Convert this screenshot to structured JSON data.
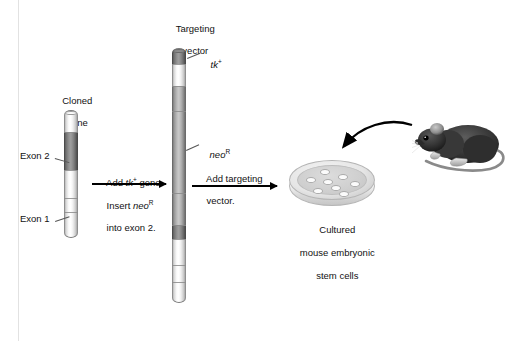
{
  "figure": {
    "background_color": "#ffffff",
    "frame_color": "#e2e2e2"
  },
  "labels": {
    "cloned_gene": "Cloned\ngene",
    "cloned_gene_line1": "Cloned",
    "cloned_gene_line2": "gene",
    "exon2": "Exon 2",
    "exon1": "Exon 1",
    "targeting_vector_line1": "Targeting",
    "targeting_vector_line2": "vector",
    "tk_gene": "tk",
    "tk_superscript": "+",
    "neo_gene": "neo",
    "neo_superscript": "R",
    "cultured_cells_line1": "Cultured",
    "cultured_cells_line2": "mouse embryonic",
    "cultured_cells_line3": "stem cells"
  },
  "arrows": {
    "step1": {
      "above_prefix": "Add ",
      "above_italic": "tk",
      "above_sup": "+",
      "above_suffix": " gene.",
      "below_line1_prefix": "Insert ",
      "below_line1_italic": "neo",
      "below_line1_sup": "R",
      "below_line2": "into exon 2."
    },
    "step2": {
      "line1": "Add targeting",
      "line2": "vector."
    },
    "mouse_to_dish": "curved-arrow-mouse-to-dish"
  },
  "cloned_gene": {
    "name": "Cloned gene",
    "segments": [
      {
        "id": "cg-seg-1",
        "type": "light",
        "top": 0,
        "height": 22,
        "shade": "#ffffff"
      },
      {
        "id": "cg-seg-2",
        "type": "dark",
        "top": 22,
        "height": 38,
        "shade": "#9e9e9e",
        "label": "Exon 2"
      },
      {
        "id": "cg-seg-3",
        "type": "light",
        "top": 60,
        "height": 28,
        "shade": "#ffffff"
      },
      {
        "id": "cg-seg-4",
        "type": "light",
        "top": 88,
        "height": 14,
        "shade": "#fafafa",
        "label": "Exon 1"
      },
      {
        "id": "cg-seg-5",
        "type": "light",
        "top": 102,
        "height": 26,
        "shade": "#ffffff"
      }
    ]
  },
  "targeting_vector": {
    "name": "Targeting vector",
    "segments": [
      {
        "id": "tv-seg-1",
        "type": "dark",
        "top": 0,
        "height": 16,
        "shade": "#8a8a8a",
        "label": "tk+"
      },
      {
        "id": "tv-seg-2",
        "type": "light",
        "top": 16,
        "height": 22,
        "shade": "#ffffff"
      },
      {
        "id": "tv-seg-3",
        "type": "mid",
        "top": 38,
        "height": 25,
        "shade": "#c0c0c0"
      },
      {
        "id": "tv-seg-4",
        "type": "mid",
        "top": 63,
        "height": 82,
        "shade": "#c4c4c4",
        "label": "neoR"
      },
      {
        "id": "tv-seg-5",
        "type": "mid",
        "top": 145,
        "height": 32,
        "shade": "#bdbdbd"
      },
      {
        "id": "tv-seg-6",
        "type": "dark",
        "top": 177,
        "height": 14,
        "shade": "#9c9c9c"
      },
      {
        "id": "tv-seg-7",
        "type": "light",
        "top": 191,
        "height": 26,
        "shade": "#ffffff"
      },
      {
        "id": "tv-seg-8",
        "type": "light",
        "top": 217,
        "height": 17,
        "shade": "#fbfbfb"
      },
      {
        "id": "tv-seg-9",
        "type": "light",
        "top": 234,
        "height": 21,
        "shade": "#ffffff"
      }
    ]
  },
  "petri_dish": {
    "name": "Cultured mouse embryonic stem cells",
    "cell_count": 8,
    "cells": [
      {
        "left": 26,
        "top": 8,
        "w": 10,
        "h": 6
      },
      {
        "left": 14,
        "top": 17,
        "w": 10,
        "h": 6
      },
      {
        "left": 32,
        "top": 18,
        "w": 10,
        "h": 6
      },
      {
        "left": 47,
        "top": 13,
        "w": 10,
        "h": 6
      },
      {
        "left": 40,
        "top": 24,
        "w": 10,
        "h": 6
      },
      {
        "left": 56,
        "top": 21,
        "w": 10,
        "h": 6
      },
      {
        "left": 22,
        "top": 29,
        "w": 10,
        "h": 6
      },
      {
        "left": 44,
        "top": 32,
        "w": 10,
        "h": 6
      }
    ],
    "dish_fill": "#cfcfcf",
    "cell_fill": "#fbfbfb"
  },
  "mouse": {
    "name": "laboratory mouse",
    "body_color": "#3a3a3a",
    "tail_color": "#808080",
    "facing": "left"
  }
}
